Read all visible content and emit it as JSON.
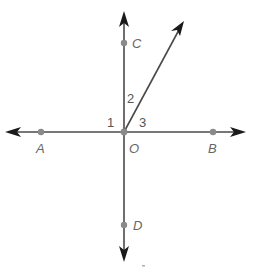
{
  "diagram": {
    "type": "geometry-angles",
    "colors": {
      "line": "#4a4a4a",
      "arrowhead": "#1a1a1a",
      "point": "#8a8a8a",
      "label": "#666666"
    },
    "origin": {
      "label": "O",
      "x": 124,
      "y": 132
    },
    "points": [
      {
        "id": "A",
        "label": "A",
        "x": 41,
        "y": 132
      },
      {
        "id": "B",
        "label": "B",
        "x": 213,
        "y": 132
      },
      {
        "id": "C",
        "label": "C",
        "x": 124,
        "y": 43
      },
      {
        "id": "D",
        "label": "D",
        "x": 124,
        "y": 225
      },
      {
        "id": "O",
        "label": "O",
        "x": 124,
        "y": 132
      }
    ],
    "angles": [
      {
        "label": "1",
        "between": "OA-OC"
      },
      {
        "label": "2",
        "between": "OC-ray"
      },
      {
        "label": "3",
        "between": "ray-OB"
      }
    ]
  }
}
